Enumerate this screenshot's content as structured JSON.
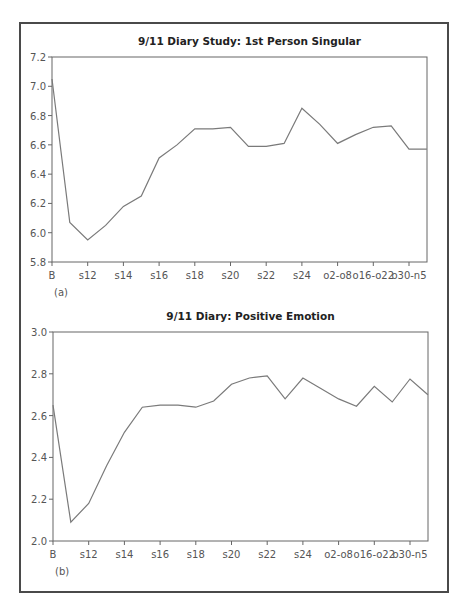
{
  "chart_data": [
    {
      "type": "line",
      "panel_label": "(a)",
      "title": "9/11 Diary Study: 1st Person Singular",
      "xlabel": "",
      "ylabel": "",
      "ylim": [
        5.8,
        7.2
      ],
      "yticks": [
        "5.8",
        "6.0",
        "6.2",
        "6.4",
        "6.6",
        "6.8",
        "7.0",
        "7.2"
      ],
      "xtick_labels": [
        "B",
        "s12",
        "s14",
        "s16",
        "s18",
        "s20",
        "s22",
        "s24",
        "o2-o8",
        "o16-o22",
        "o30-n5"
      ],
      "grid": false,
      "legend": null,
      "series": [
        {
          "name": "1st Person Singular",
          "values": [
            7.05,
            6.07,
            5.95,
            6.05,
            6.18,
            6.25,
            6.51,
            6.6,
            6.71,
            6.71,
            6.72,
            6.59,
            6.59,
            6.61,
            6.85,
            6.74,
            6.61,
            6.67,
            6.72,
            6.73,
            6.57,
            6.57
          ]
        }
      ]
    },
    {
      "type": "line",
      "panel_label": "(b)",
      "title": "9/11 Diary: Positive Emotion",
      "xlabel": "",
      "ylabel": "",
      "ylim": [
        2.0,
        3.0
      ],
      "yticks": [
        "2.0",
        "2.2",
        "2.4",
        "2.6",
        "2.8",
        "3.0"
      ],
      "xtick_labels": [
        "B",
        "s12",
        "s14",
        "s16",
        "s18",
        "s20",
        "s22",
        "s24",
        "o2-o8",
        "o16-o22",
        "o30-n5"
      ],
      "grid": false,
      "legend": null,
      "series": [
        {
          "name": "Positive Emotion",
          "values": [
            2.65,
            2.09,
            2.18,
            2.36,
            2.52,
            2.64,
            2.65,
            2.65,
            2.64,
            2.67,
            2.75,
            2.78,
            2.79,
            2.68,
            2.78,
            2.73,
            2.68,
            2.645,
            2.74,
            2.665,
            2.775,
            2.7
          ]
        }
      ]
    }
  ],
  "colors": {
    "line": "#7a7a7a",
    "axis": "#666666",
    "frame": "#4a4a4a"
  }
}
